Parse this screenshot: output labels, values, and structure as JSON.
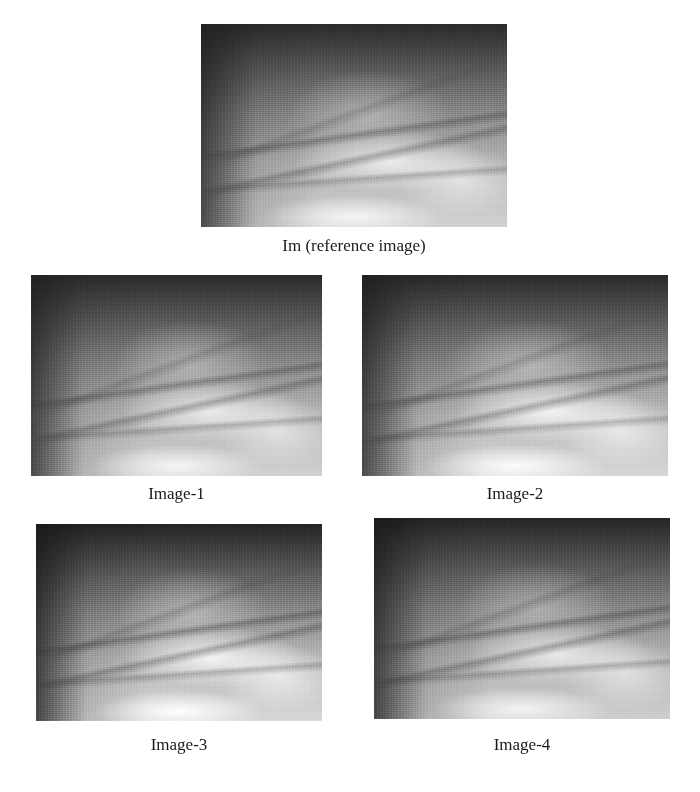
{
  "figure": {
    "reference": {
      "caption": "Im (reference image)",
      "image_description": "grayscale finger-vein image, dark top-left, bright lower-right with dark vein streaks"
    },
    "images": [
      {
        "caption": "Image-1",
        "image_description": "grayscale finger-vein image"
      },
      {
        "caption": "Image-2",
        "image_description": "grayscale finger-vein image"
      },
      {
        "caption": "Image-3",
        "image_description": "grayscale finger-vein image"
      },
      {
        "caption": "Image-4",
        "image_description": "grayscale finger-vein image"
      }
    ]
  }
}
